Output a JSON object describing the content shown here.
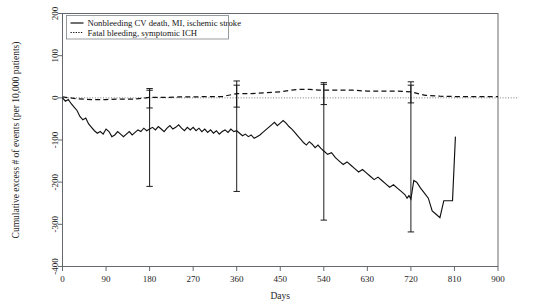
{
  "chart_data": {
    "type": "line",
    "title": "",
    "subtitle": "",
    "xlabel": "Days",
    "ylabel": "Cumulative excess # of events (per 10,000 patients)",
    "xlim": [
      0,
      900
    ],
    "ylim": [
      -400,
      200
    ],
    "xticks": [
      0,
      90,
      180,
      270,
      360,
      450,
      540,
      630,
      720,
      810,
      900
    ],
    "xticklabels": [
      "0",
      "90",
      "180",
      "270",
      "360",
      "450",
      "540",
      "630",
      "720",
      "810",
      "900"
    ],
    "yticks": [
      -400,
      -300,
      -200,
      -100,
      0,
      100,
      200
    ],
    "yticklabels": [
      "-400",
      "-300",
      "-200",
      "-100",
      "0",
      "100",
      "200"
    ],
    "grid": false,
    "legend_position": "top-left",
    "reference_line": {
      "y": 0,
      "style": "dotted",
      "color": "#6e6e6e"
    },
    "series": [
      {
        "name": "Nonbleeding CV death, MI, ischemic stroke",
        "style": "solid",
        "color": "#111111",
        "x": [
          0,
          6,
          12,
          18,
          24,
          30,
          36,
          42,
          48,
          54,
          60,
          66,
          72,
          78,
          84,
          90,
          96,
          102,
          108,
          114,
          120,
          126,
          132,
          138,
          144,
          150,
          156,
          162,
          168,
          174,
          180,
          186,
          192,
          198,
          204,
          210,
          216,
          222,
          228,
          234,
          240,
          246,
          252,
          258,
          264,
          270,
          276,
          282,
          288,
          294,
          300,
          306,
          312,
          318,
          324,
          330,
          336,
          342,
          348,
          354,
          360,
          366,
          372,
          378,
          384,
          390,
          396,
          402,
          408,
          414,
          420,
          426,
          432,
          438,
          444,
          450,
          456,
          462,
          468,
          474,
          480,
          486,
          492,
          498,
          504,
          510,
          516,
          522,
          528,
          534,
          540,
          548,
          556,
          564,
          572,
          580,
          588,
          596,
          604,
          612,
          620,
          628,
          636,
          644,
          652,
          660,
          668,
          676,
          684,
          692,
          700,
          708,
          712,
          716,
          720,
          726,
          732,
          740,
          748,
          756,
          764,
          772,
          780,
          788,
          796,
          804,
          806,
          812
        ],
        "y": [
          0,
          -8,
          -4,
          -14,
          -22,
          -30,
          -44,
          -52,
          -48,
          -62,
          -70,
          -78,
          -84,
          -80,
          -86,
          -74,
          -80,
          -92,
          -88,
          -80,
          -86,
          -92,
          -86,
          -80,
          -88,
          -82,
          -76,
          -80,
          -72,
          -78,
          -74,
          -70,
          -76,
          -68,
          -74,
          -80,
          -72,
          -66,
          -74,
          -70,
          -64,
          -72,
          -78,
          -70,
          -76,
          -70,
          -78,
          -72,
          -80,
          -74,
          -82,
          -76,
          -84,
          -78,
          -86,
          -80,
          -76,
          -82,
          -74,
          -80,
          -78,
          -84,
          -90,
          -86,
          -92,
          -88,
          -96,
          -92,
          -88,
          -82,
          -76,
          -70,
          -64,
          -58,
          -66,
          -60,
          -54,
          -60,
          -68,
          -74,
          -82,
          -90,
          -98,
          -106,
          -112,
          -104,
          -110,
          -118,
          -112,
          -120,
          -126,
          -134,
          -130,
          -142,
          -150,
          -158,
          -152,
          -160,
          -168,
          -176,
          -170,
          -178,
          -186,
          -194,
          -188,
          -196,
          -204,
          -212,
          -206,
          -214,
          -222,
          -230,
          -238,
          -232,
          -240,
          -196,
          -200,
          -214,
          -226,
          -238,
          -268,
          -276,
          -284,
          -244,
          -244,
          -244,
          -244,
          -92
        ]
      },
      {
        "name": "Fatal bleeding, symptomic ICH",
        "style": "dashed",
        "color": "#111111",
        "x": [
          0,
          30,
          60,
          90,
          120,
          150,
          180,
          210,
          240,
          270,
          300,
          330,
          360,
          390,
          420,
          450,
          470,
          490,
          510,
          530,
          540,
          570,
          600,
          630,
          660,
          690,
          720,
          750,
          780,
          810,
          840,
          870,
          900
        ],
        "y": [
          2,
          -2,
          -4,
          -4,
          -3,
          -3,
          1,
          1,
          2,
          2,
          3,
          3,
          10,
          10,
          12,
          14,
          18,
          20,
          20,
          18,
          18,
          18,
          18,
          16,
          16,
          16,
          14,
          6,
          4,
          3,
          3,
          3,
          3
        ]
      }
    ],
    "error_bars": [
      {
        "series": "Nonbleeding CV death, MI, ischemic stroke",
        "x": 180,
        "y": -74,
        "low": -210,
        "high": 18
      },
      {
        "series": "Nonbleeding CV death, MI, ischemic stroke",
        "x": 360,
        "y": -78,
        "low": -222,
        "high": 40
      },
      {
        "series": "Nonbleeding CV death, MI, ischemic stroke",
        "x": 540,
        "y": -126,
        "low": -290,
        "high": 36
      },
      {
        "series": "Nonbleeding CV death, MI, ischemic stroke",
        "x": 720,
        "y": -240,
        "low": -318,
        "high": 38
      },
      {
        "series": "Fatal bleeding, symptomic ICH",
        "x": 180,
        "y": 1,
        "low": -24,
        "high": 22
      },
      {
        "series": "Fatal bleeding, symptomic ICH",
        "x": 360,
        "y": 10,
        "low": -22,
        "high": 30
      },
      {
        "series": "Fatal bleeding, symptomic ICH",
        "x": 540,
        "y": 18,
        "low": -16,
        "high": 32
      },
      {
        "series": "Fatal bleeding, symptomic ICH",
        "x": 720,
        "y": 14,
        "low": -12,
        "high": 30
      }
    ]
  },
  "legend": {
    "items": [
      {
        "label": "Nonbleeding CV death, MI, ischemic stroke",
        "style": "solid"
      },
      {
        "label": "Fatal bleeding, symptomic ICH",
        "style": "dotted"
      }
    ]
  },
  "axes": {
    "x_title": "Days",
    "y_title": "Cumulative excess # of events (per 10,000 patients)"
  }
}
